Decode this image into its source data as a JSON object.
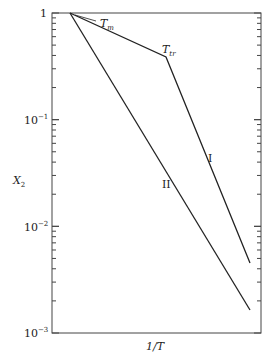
{
  "chart_data": {
    "type": "line",
    "title": "",
    "xlabel": "1/T",
    "ylabel": "X2",
    "yscale": "log",
    "ylim": [
      0.001,
      1
    ],
    "yticks": [
      "1",
      "10^-1",
      "10^-2",
      "10^-3"
    ],
    "grid": false,
    "legend": "none (inline labels)",
    "series": [
      {
        "name": "I",
        "points": [
          {
            "x": 0.08,
            "y": 1.0,
            "label": "Tm"
          },
          {
            "x": 0.54,
            "y": 0.39,
            "label": "Ttr"
          },
          {
            "x": 0.95,
            "y": 0.0085
          }
        ]
      },
      {
        "name": "II",
        "points": [
          {
            "x": 0.08,
            "y": 1.0,
            "label": "Tm"
          },
          {
            "x": 0.95,
            "y": 0.0017
          }
        ]
      }
    ],
    "annotations": [
      {
        "text": "Tm",
        "at": "melting point, X2 = 1"
      },
      {
        "text": "Ttr",
        "at": "transition point on curve I"
      }
    ]
  },
  "labels": {
    "xlabel": "1/T",
    "ylabel_main": "X",
    "ylabel_sub": "2",
    "ytick_1": "1",
    "ytick_base": "10",
    "ytick_exp_1": "−1",
    "ytick_exp_2": "−2",
    "ytick_exp_3": "−3",
    "tm_main": "T",
    "tm_sub": "m",
    "ttr_main": "T",
    "ttr_sub": "tr",
    "curve_I": "I",
    "curve_II": "II"
  },
  "colors": {
    "line": "#222222",
    "axis": "#444444"
  }
}
